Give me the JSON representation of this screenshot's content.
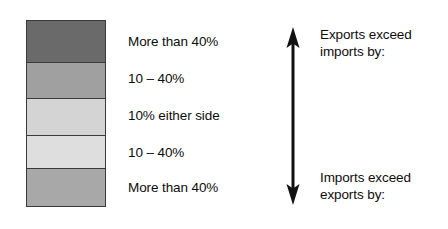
{
  "legend": {
    "title": "Trade balance legend",
    "swatch_bands": [
      {
        "label": "More than 40%",
        "color": "#6a6a6a",
        "meaning": "Exports exceed imports by more than 40%"
      },
      {
        "label": "10 – 40%",
        "color": "#a0a0a0",
        "meaning": "Exports exceed imports by 10 to 40%"
      },
      {
        "label": "10% either side",
        "color": "#d4d4d4",
        "meaning": "Balanced within 10% either side"
      },
      {
        "label": "10 – 40%",
        "color": "#dedede",
        "meaning": "Imports exceed exports by 10 to 40%"
      },
      {
        "label": "More than 40%",
        "color": "#a8a8a8",
        "meaning": "Imports exceed exports by more than 40%"
      }
    ],
    "arrow": {
      "icon": "double-headed-vertical-arrow",
      "color": "#111111",
      "top_caption": {
        "line1": "Exports exceed",
        "line2": "imports by:"
      },
      "bottom_caption": {
        "line1": "Imports exceed",
        "line2": "exports by:"
      }
    },
    "background_color": "#ffffff",
    "text_color": "#0d0d0d",
    "border_color": "#3a3a3a"
  }
}
